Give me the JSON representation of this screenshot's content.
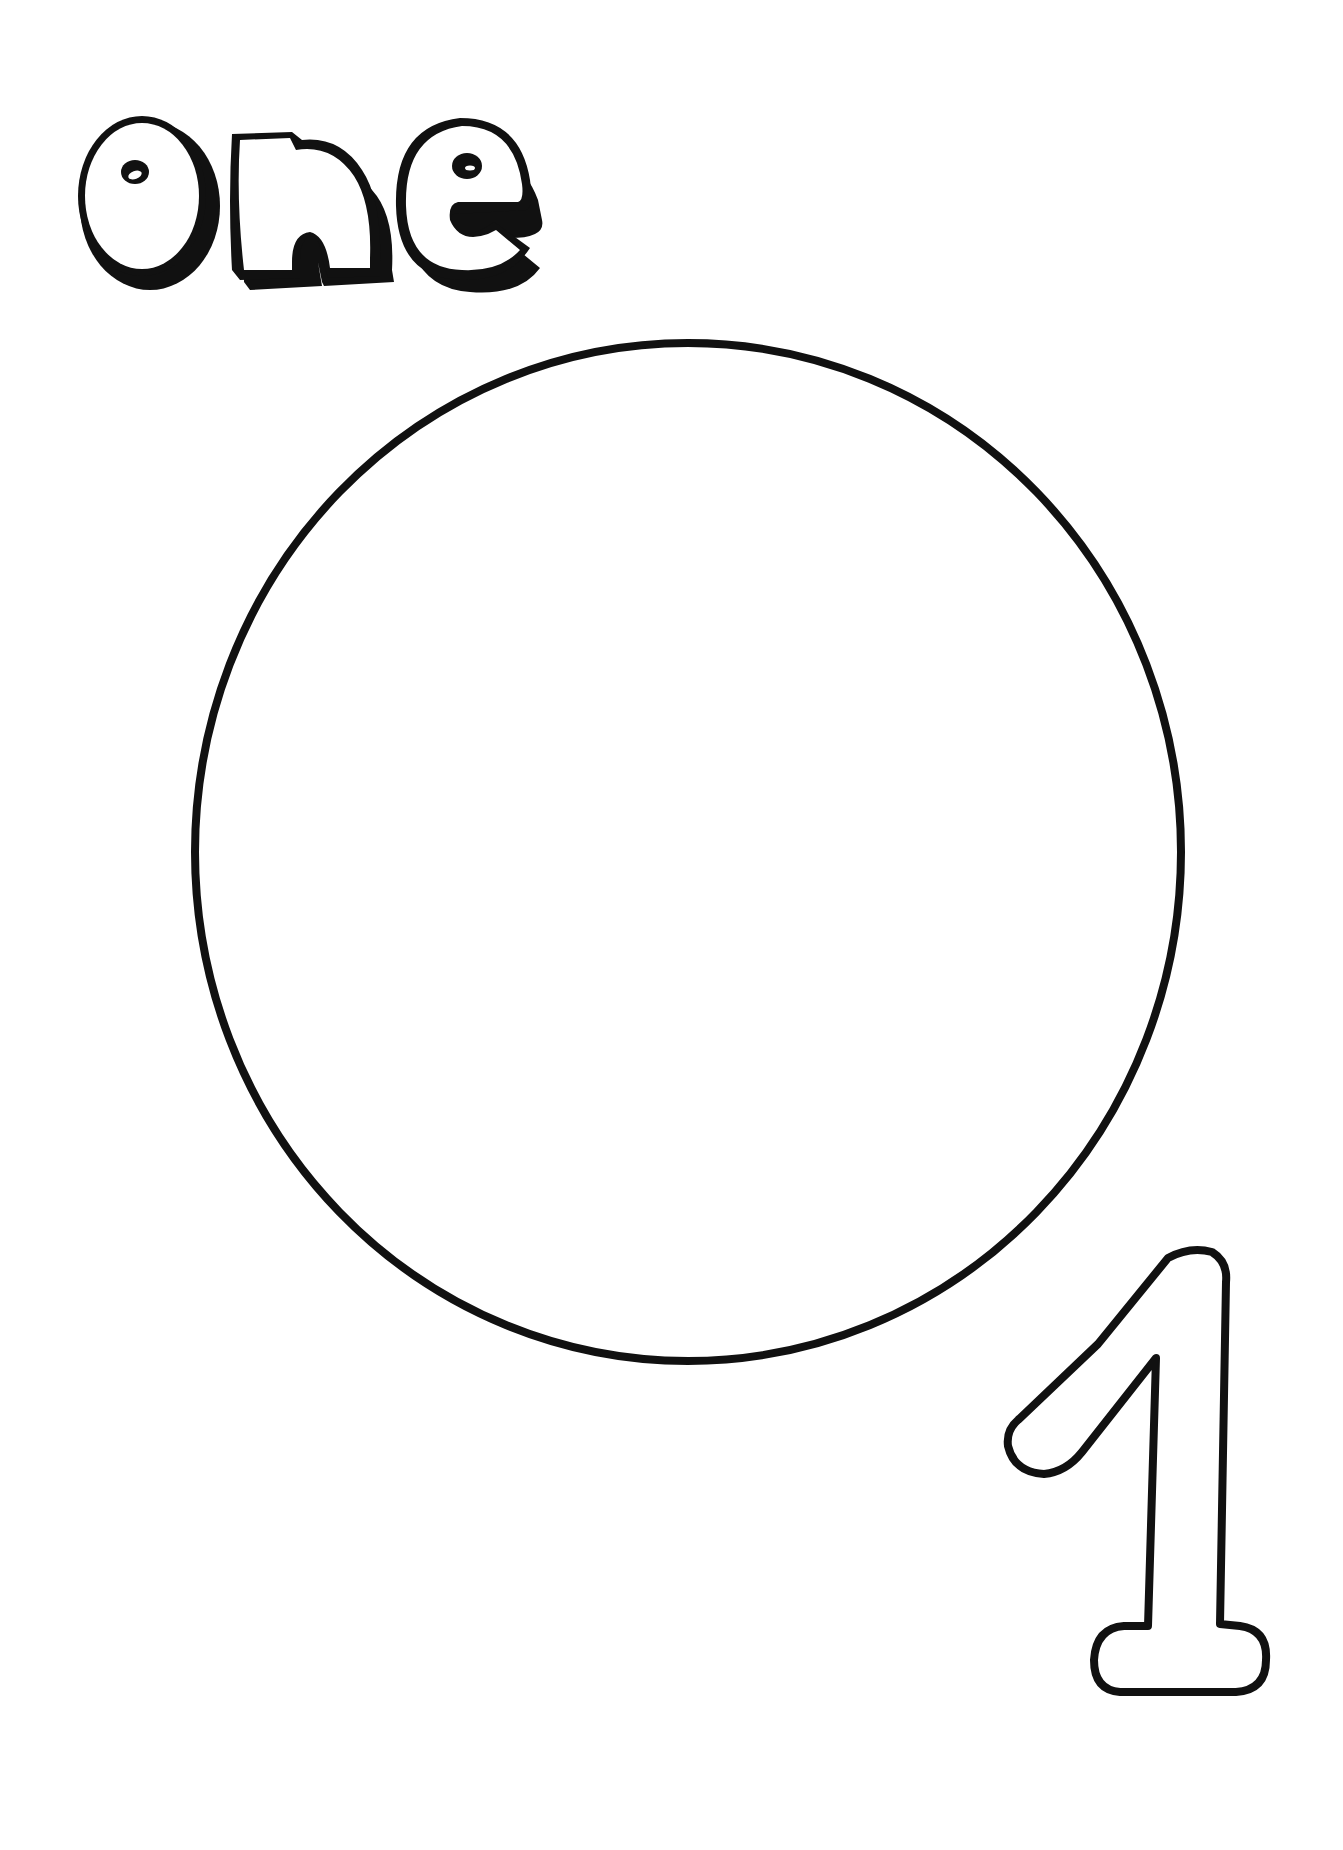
{
  "worksheet": {
    "word": "one",
    "numeral": "1",
    "shape": "circle",
    "shape_count": 1,
    "colors": {
      "ink": "#111111",
      "paper": "#ffffff"
    }
  }
}
